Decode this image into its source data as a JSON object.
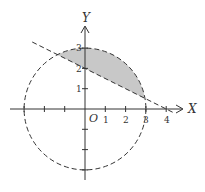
{
  "figure": {
    "axes": {
      "x_label": "X",
      "y_label": "Y",
      "origin_label": "O",
      "x_ticks": [
        "1",
        "2",
        "3",
        "4"
      ],
      "y_ticks": [
        "1",
        "2",
        "3"
      ]
    },
    "circle": {
      "center": [
        0,
        0
      ],
      "radius": 3,
      "style": "dashed"
    },
    "line": {
      "points": [
        [
          0,
          2
        ],
        [
          4,
          0
        ]
      ],
      "style": "dashed"
    },
    "shaded_region": "region inside circle above the line",
    "colors": {
      "stroke": "#333333",
      "fill": "#c8c8c8"
    }
  }
}
